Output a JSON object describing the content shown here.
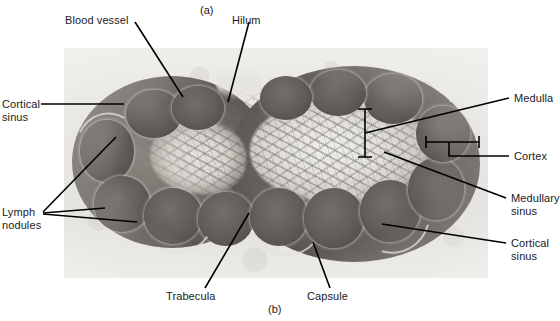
{
  "figure": {
    "panel_labels": {
      "top": "(a)",
      "bottom": "(b)"
    }
  },
  "micrograph": {
    "name": "lymph-node-section",
    "description": "Light micrograph of a bean-shaped lymph node in cross section showing cortex, medulla, nodules, sinuses and capsule"
  },
  "labels": {
    "blood_vessel": "Blood vessel",
    "hilum": "Hilum",
    "cortical_sinus_top": "Cortical\nsinus",
    "lymph_nodules": "Lymph\nnodules",
    "trabecula": "Trabecula",
    "capsule": "Capsule",
    "medulla": "Medulla",
    "cortex": "Cortex",
    "medullary_sinus": "Medullary\nsinus",
    "cortical_sinus_bottom": "Cortical\nsinus"
  },
  "colors": {
    "text": "#1a1a1a",
    "leader_line": "#000000",
    "slide_background": "#e9e7e2",
    "tissue_dark": "#5a5550",
    "tissue_pale": "#e4e2dd"
  }
}
